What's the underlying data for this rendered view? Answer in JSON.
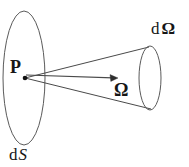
{
  "figure": {
    "background_color": "#ffffff",
    "stroke_color": "#4a4a4a",
    "text_color": "#161616",
    "labels": {
      "vertex_point": "P",
      "cone_base_d": "d",
      "cone_base_omega": "Ω",
      "cone_base_full": "dΩ",
      "axis_vector": "Ω",
      "surface_d": "d",
      "surface_s": "S",
      "surface_full": "dS"
    },
    "geometry": {
      "surface_ellipse": {
        "cx": 24,
        "cy": 78,
        "rx": 21,
        "ry": 67
      },
      "cone_base_ellipse": {
        "cx": 150,
        "cy": 78,
        "rx": 11,
        "ry": 32
      },
      "vertex_dot": {
        "cx": 25,
        "cy": 78,
        "r": 2.2
      },
      "cone_upper_edge": {
        "x1": 25,
        "y1": 78,
        "x2": 149,
        "y2": 47
      },
      "cone_lower_edge": {
        "x1": 25,
        "y1": 78,
        "x2": 151,
        "y2": 109
      },
      "axis_arrow": {
        "x1": 26,
        "y1": 75,
        "x2": 117,
        "y2": 78
      }
    }
  }
}
